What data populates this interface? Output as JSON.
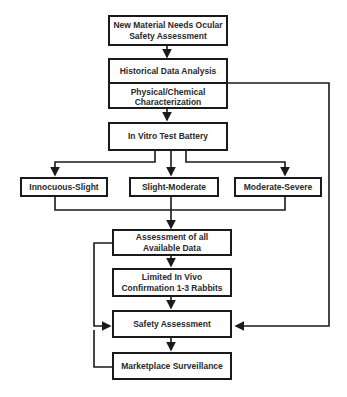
{
  "diagram": {
    "type": "flowchart",
    "nodes": {
      "start": "New Material Needs Ocular Safety Assessment",
      "historical": "Historical Data Analysis",
      "physchem": "Physical/Chemical Characterization",
      "invitro": "In Vitro Test Battery",
      "innocuous": "Innocuous-Slight",
      "slight_mod": "Slight-Moderate",
      "mod_severe": "Moderate-Severe",
      "assessment_all": "Assessment of all Available Data",
      "invivo": "Limited In Vivo Confirmation 1-3 Rabbits",
      "safety": "Safety Assessment",
      "surveillance": "Marketplace Surveillance"
    },
    "edges": [
      [
        "start",
        "historical"
      ],
      [
        "physchem",
        "invitro"
      ],
      [
        "historical",
        "safety"
      ],
      [
        "invitro",
        "innocuous"
      ],
      [
        "invitro",
        "slight_mod"
      ],
      [
        "invitro",
        "mod_severe"
      ],
      [
        "innocuous",
        "assessment_all"
      ],
      [
        "slight_mod",
        "assessment_all"
      ],
      [
        "mod_severe",
        "assessment_all"
      ],
      [
        "assessment_all",
        "invivo"
      ],
      [
        "assessment_all",
        "safety"
      ],
      [
        "invivo",
        "safety"
      ],
      [
        "safety",
        "surveillance"
      ],
      [
        "surveillance",
        "safety"
      ]
    ]
  }
}
